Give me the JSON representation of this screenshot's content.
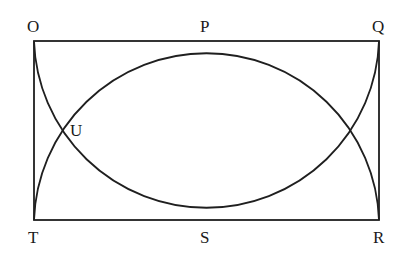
{
  "diagram": {
    "type": "geometry",
    "labels": {
      "O": "O",
      "P": "P",
      "Q": "Q",
      "R": "R",
      "S": "S",
      "T": "T",
      "U": "U"
    },
    "rectangle": {
      "x": 34,
      "y": 41,
      "width": 345,
      "height": 179
    },
    "arcs": [
      {
        "name": "upper-arc",
        "through": [
          "T",
          "P",
          "R"
        ]
      },
      {
        "name": "lower-arc",
        "through": [
          "O",
          "S",
          "Q"
        ]
      }
    ],
    "stroke_color": "#1f1f1f"
  }
}
